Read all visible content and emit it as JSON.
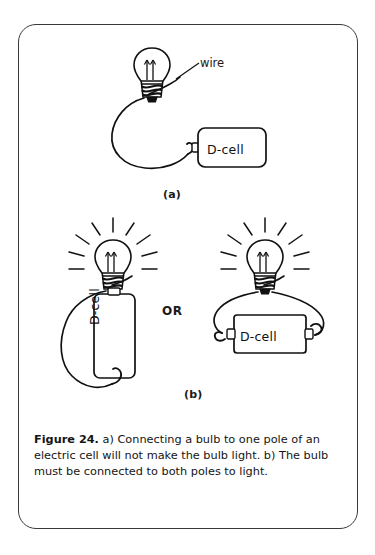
{
  "figure": {
    "id": "figure-24",
    "number_label": "Figure 24.",
    "caption_body": " a) Connecting a bulb to one pole of an electric cell will not make the bulb light. b) The bulb must be connected to both poles to light.",
    "panel_a_label": "(a)",
    "panel_b_label": "(b)",
    "or_label": "OR",
    "wire_annotation": "wire",
    "cell_label_a": "D-cell",
    "cell_label_b_left": "D-cell",
    "cell_label_b_right": "D-cell",
    "colors": {
      "ink": "#1a1a1a",
      "frame": "#3a3a3a",
      "background": "#ffffff"
    }
  }
}
